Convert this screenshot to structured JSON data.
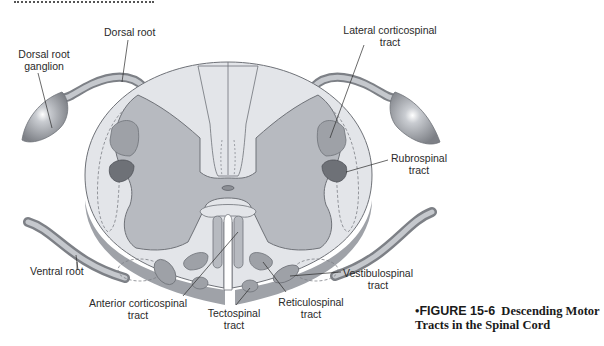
{
  "header": {
    "cropped_title": "Spinal Cord"
  },
  "labels": {
    "dorsal_root": "Dorsal root",
    "dorsal_root_ganglion_1": "Dorsal root",
    "dorsal_root_ganglion_2": "ganglion",
    "lateral_corticospinal_1": "Lateral corticospinal",
    "lateral_corticospinal_2": "tract",
    "rubrospinal_1": "Rubrospinal",
    "rubrospinal_2": "tract",
    "ventral_root": "Ventral root",
    "anterior_corticospinal_1": "Anterior corticospinal",
    "anterior_corticospinal_2": "tract",
    "tectospinal_1": "Tectospinal",
    "tectospinal_2": "tract",
    "reticulospinal_1": "Reticulospinal",
    "reticulospinal_2": "tract",
    "vestibulospinal_1": "Vestibulospinal",
    "vestibulospinal_2": "tract"
  },
  "caption": {
    "bullet": "•",
    "figure_number": "FIGURE 15-6",
    "title_line1": "Descending Motor",
    "title_line2": "Tracts in the Spinal Cord"
  },
  "colors": {
    "white_matter": "#e3e5e9",
    "gray_matter": "#b7bac0",
    "outline": "#6f7278",
    "tract_light": "#9ea1a7",
    "tract_dark": "#6e7177",
    "root": "#a9acb2"
  }
}
